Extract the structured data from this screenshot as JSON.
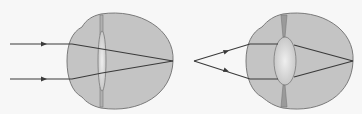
{
  "diagram": {
    "panels": [
      {
        "id": "distant-object",
        "description": "Parallel rays from a distant object focused by a thin (relaxed) lens onto the retina",
        "rays": "parallel",
        "lens": "thin"
      },
      {
        "id": "near-object",
        "description": "Diverging rays from a near point object focused by a thick (accommodated) lens onto the retina",
        "rays": "diverging",
        "lens": "thick"
      }
    ],
    "colors": {
      "background": "#f7f7f7",
      "eyeball_fill": "#c4c4c4",
      "eyeball_stroke": "#7a7a7a",
      "lens_fill": "#d6d6d6",
      "lens_highlight": "#ececec",
      "ray": "#3a3a3a",
      "ciliary": "#8a8a8a"
    }
  }
}
